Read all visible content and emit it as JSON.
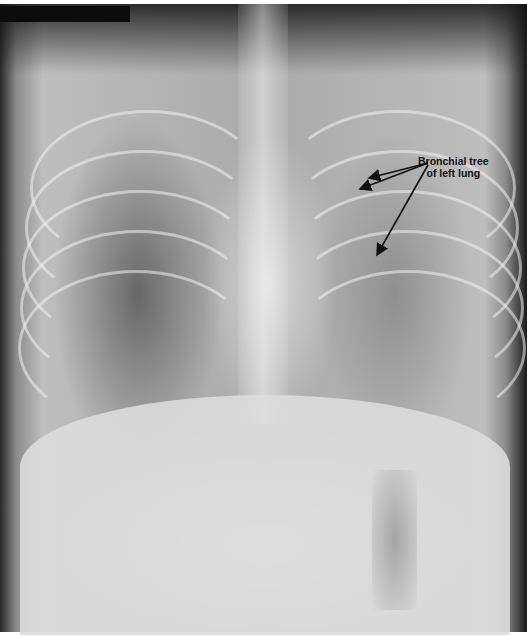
{
  "image": {
    "type": "chest-xray-frontal",
    "annotation": {
      "line1": "Bronchial tree",
      "line2": "of left lung",
      "arrow_origin": [
        428,
        163
      ],
      "arrow_targets": [
        [
          369,
          178
        ],
        [
          360,
          189
        ],
        [
          377,
          255
        ]
      ]
    },
    "colors": {
      "annotation_text": "#111111",
      "arrow": "#111111",
      "background": "#ffffff"
    }
  }
}
